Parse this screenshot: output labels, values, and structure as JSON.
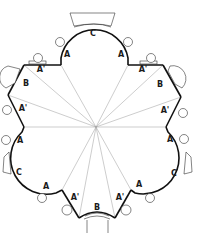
{
  "diagram": {
    "type": "floor-plan",
    "colors": {
      "wall": "#111111",
      "ray": "#9a9a9a",
      "furniture": "#333333"
    },
    "labels": [
      {
        "id": "top-c",
        "text": "C",
        "x": 93,
        "y": 34
      },
      {
        "id": "top-a-left",
        "text": "A",
        "x": 67,
        "y": 55
      },
      {
        "id": "top-a-right",
        "text": "A",
        "x": 121,
        "y": 55
      },
      {
        "id": "top-left-a-prime",
        "text": "A'",
        "x": 41,
        "y": 70
      },
      {
        "id": "top-right-a-prime",
        "text": "A'",
        "x": 143,
        "y": 70
      },
      {
        "id": "left-b",
        "text": "B",
        "x": 26,
        "y": 84
      },
      {
        "id": "right-b",
        "text": "B",
        "x": 160,
        "y": 85
      },
      {
        "id": "left-a-prime",
        "text": "A'",
        "x": 23,
        "y": 109
      },
      {
        "id": "right-a-prime",
        "text": "A'",
        "x": 165,
        "y": 111
      },
      {
        "id": "left-a-upper",
        "text": "A",
        "x": 20,
        "y": 141
      },
      {
        "id": "right-a-upper",
        "text": "A",
        "x": 170,
        "y": 140
      },
      {
        "id": "left-c",
        "text": "C",
        "x": 19,
        "y": 173
      },
      {
        "id": "right-c",
        "text": "C",
        "x": 174,
        "y": 174
      },
      {
        "id": "left-a-lower",
        "text": "A",
        "x": 46,
        "y": 187
      },
      {
        "id": "right-a-lower",
        "text": "A",
        "x": 139,
        "y": 185
      },
      {
        "id": "bottom-left-a-prime",
        "text": "A'",
        "x": 75,
        "y": 198
      },
      {
        "id": "bottom-right-a-prime",
        "text": "A'",
        "x": 120,
        "y": 198
      },
      {
        "id": "bottom-b",
        "text": "B",
        "x": 97,
        "y": 208
      }
    ],
    "center": {
      "x": 96,
      "y": 127
    }
  }
}
